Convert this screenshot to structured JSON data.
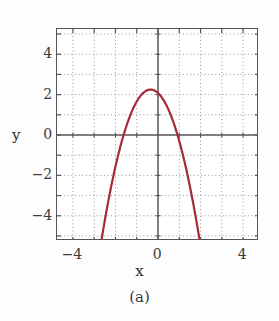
{
  "figure": {
    "caption": "(a)"
  },
  "chart_data": {
    "type": "line",
    "title": "",
    "xlabel": "x",
    "ylabel": "y",
    "xlim": [
      -4.75,
      4.75
    ],
    "ylim": [
      -5.25,
      5.25
    ],
    "grid": true,
    "grid_style": "dotted",
    "grid_step": 1,
    "legend": "none",
    "xticks": [
      -4,
      -2,
      0,
      2,
      4
    ],
    "yticks": [
      -4,
      -2,
      0,
      2,
      4
    ],
    "xtick_labels": [
      "−4",
      "",
      "0",
      "",
      "4"
    ],
    "ytick_labels": [
      "−4",
      "−2",
      "0",
      "2",
      "4"
    ],
    "axis_lines": {
      "x_zero": 0,
      "y_zero": 0
    },
    "series": [
      {
        "name": "parabola",
        "color": "#a52a3a",
        "linewidth": 2.2,
        "equation": "y = -1.4(x + 0.35)^2 + 2.25",
        "vertex": [
          -0.35,
          2.25
        ],
        "roots": [
          -1.62,
          0.92
        ],
        "x": [
          -2.62,
          -2.4,
          -2.2,
          -2.0,
          -1.8,
          -1.6,
          -1.4,
          -1.2,
          -1.0,
          -0.8,
          -0.6,
          -0.35,
          -0.1,
          0.1,
          0.3,
          0.5,
          0.7,
          0.9,
          1.1,
          1.3,
          1.5,
          1.7,
          1.92
        ],
        "y": [
          -5.25,
          -3.98,
          -2.94,
          -2.0,
          -1.16,
          -0.42,
          0.22,
          0.76,
          1.2,
          1.54,
          1.78,
          2.25,
          1.97,
          1.96,
          1.74,
          1.23,
          0.79,
          0.25,
          -0.39,
          -1.13,
          -1.97,
          -2.91,
          -4.07
        ]
      }
    ]
  },
  "axis": {
    "y_title": "y",
    "x_title": "x"
  }
}
